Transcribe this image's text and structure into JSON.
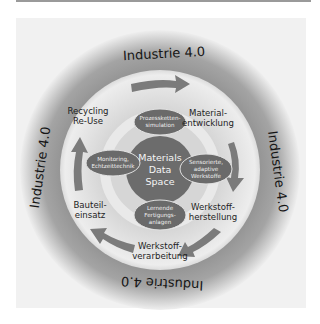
{
  "diagram": {
    "ring_label": "Industrie 4.0",
    "core": {
      "lines": [
        "Materials",
        "Data",
        "Space"
      ]
    },
    "process_steps": [
      {
        "lines": [
          "Material-",
          "entwicklung"
        ]
      },
      {
        "lines": [
          "Werkstoff-",
          "herstellung"
        ]
      },
      {
        "lines": [
          "Werkstoff-",
          "verarbeitung"
        ]
      },
      {
        "lines": [
          "Bauteil-",
          "einsatz"
        ]
      },
      {
        "lines": [
          "Recycling",
          "Re-Use"
        ]
      }
    ],
    "technologies": [
      {
        "lines": [
          "Prozessketten-",
          "simulation"
        ]
      },
      {
        "lines": [
          "Sensorierte,",
          "adaptive",
          "Werkstoffe"
        ]
      },
      {
        "lines": [
          "Lernende",
          "Fertigungs-",
          "anlagen"
        ]
      },
      {
        "lines": [
          "Monitoring,",
          "Echtzeittechnik"
        ]
      }
    ],
    "colors": {
      "outer_ring": "#9d9d9d",
      "light_ring": "#e6e6e6",
      "arrow": "#7a7a7a",
      "oval": "#6a6a6a",
      "core": "#6e6e6e",
      "inner_band": "#a8a8a8"
    }
  }
}
